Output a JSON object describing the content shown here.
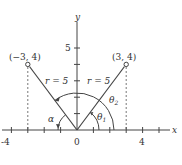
{
  "axes": {
    "x_label": "x",
    "y_label": "y",
    "x_ticks": [
      "-4",
      "0",
      "4"
    ],
    "y_ticks": [
      "5"
    ]
  },
  "points": [
    {
      "label": "(−3, 4)",
      "x": -3,
      "y": 4
    },
    {
      "label": "(3, 4)",
      "x": 3,
      "y": 4
    }
  ],
  "radius_labels": [
    "r = 5",
    "r = 5"
  ],
  "angles": {
    "alpha": "α",
    "theta1": "θ",
    "theta1_sub": "1",
    "theta2": "θ",
    "theta2_sub": "2"
  },
  "colors": {
    "line": "#444444",
    "text": "#333333"
  }
}
